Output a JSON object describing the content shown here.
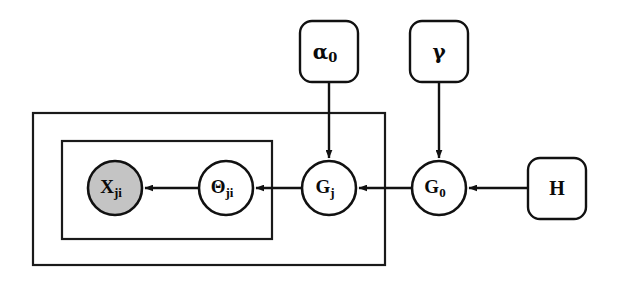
{
  "diagram": {
    "background_color": "#ffffff",
    "stroke_color": "#111111",
    "shaded_fill_color": "#c4c4c4",
    "open_fill_color": "#ffffff"
  },
  "nodes": [
    {
      "id": "x",
      "symbol": "X",
      "subscript": "ji",
      "shape": "circle",
      "shaded": true,
      "observed": true,
      "cx": 115,
      "cy": 188,
      "r": 27
    },
    {
      "id": "theta",
      "symbol": "Θ",
      "subscript": "ji",
      "shape": "circle",
      "shaded": false,
      "observed": false,
      "cx": 226,
      "cy": 188,
      "r": 27
    },
    {
      "id": "gj",
      "symbol": "G",
      "subscript": "j",
      "shape": "circle",
      "shaded": false,
      "observed": false,
      "cx": 329,
      "cy": 188,
      "r": 27
    },
    {
      "id": "g0",
      "symbol": "G",
      "subscript": "0",
      "shape": "circle",
      "shaded": false,
      "observed": false,
      "cx": 439,
      "cy": 188,
      "r": 27
    }
  ],
  "params": [
    {
      "id": "alpha0",
      "symbol": "α",
      "subscript": "0",
      "shape": "rounded-rect",
      "x": 300,
      "y": 21,
      "width": 58,
      "height": 61,
      "rx": 12
    },
    {
      "id": "gamma",
      "symbol": "γ",
      "subscript": "",
      "shape": "rounded-rect",
      "x": 410,
      "y": 21,
      "width": 58,
      "height": 61,
      "rx": 12
    },
    {
      "id": "h",
      "symbol": "H",
      "subscript": "",
      "shape": "rounded-rect",
      "x": 528,
      "y": 158,
      "width": 58,
      "height": 61,
      "rx": 12
    }
  ],
  "plates": [
    {
      "id": "outer-plate",
      "label": "",
      "x": 33,
      "y": 113,
      "width": 352,
      "height": 152
    },
    {
      "id": "inner-plate",
      "label": "",
      "x": 62,
      "y": 141,
      "width": 210,
      "height": 98
    }
  ],
  "edges": [
    {
      "id": "theta-to-x",
      "from": "theta",
      "to": "x",
      "direction": "left",
      "arrow": true
    },
    {
      "id": "gj-to-theta",
      "from": "gj",
      "to": "theta",
      "direction": "left",
      "arrow": true
    },
    {
      "id": "g0-to-gj",
      "from": "g0",
      "to": "gj",
      "direction": "left",
      "arrow": true
    },
    {
      "id": "h-to-g0",
      "from": "h",
      "to": "g0",
      "direction": "left",
      "arrow": true
    },
    {
      "id": "alpha0-to-gj",
      "from": "alpha0",
      "to": "gj",
      "direction": "down",
      "arrow": true
    },
    {
      "id": "gamma-to-g0",
      "from": "gamma",
      "to": "g0",
      "direction": "down",
      "arrow": true
    }
  ],
  "chart_data": {
    "type": "diagram",
    "subtype": "probabilistic-graphical-model-plate-notation",
    "node_labels": [
      "X_ji",
      "Θ_ji",
      "G_j",
      "G_0"
    ],
    "parameter_labels": [
      "α_0",
      "γ",
      "H"
    ],
    "observed_nodes": [
      "X_ji"
    ],
    "latent_nodes": [
      "Θ_ji",
      "G_j",
      "G_0"
    ],
    "plate_count": 2,
    "edge_list": [
      "Θ_ji → X_ji",
      "G_j → Θ_ji",
      "G_0 → G_j",
      "H → G_0",
      "α_0 → G_j",
      "γ → G_0"
    ]
  }
}
